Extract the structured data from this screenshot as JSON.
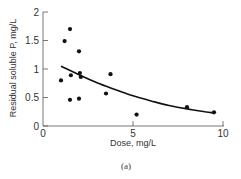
{
  "chart_data": {
    "type": "scatter",
    "title": "",
    "caption": "(a)",
    "xlabel": "Dose, mg/L",
    "ylabel": "Residual soluble P, mg/L",
    "xlim": [
      0,
      10
    ],
    "ylim": [
      0,
      2
    ],
    "x_ticks": [
      "0",
      "5",
      "10"
    ],
    "y_ticks": [
      "0",
      "0.5",
      "1",
      "1.5",
      "2"
    ],
    "grid": false,
    "legend": null,
    "series": [
      {
        "name": "observations",
        "type": "scatter",
        "points": [
          {
            "x": 1.0,
            "y": 0.8
          },
          {
            "x": 1.2,
            "y": 1.49
          },
          {
            "x": 1.5,
            "y": 1.7
          },
          {
            "x": 2.0,
            "y": 1.31
          },
          {
            "x": 1.55,
            "y": 0.89
          },
          {
            "x": 1.5,
            "y": 0.46
          },
          {
            "x": 2.0,
            "y": 0.48
          },
          {
            "x": 2.05,
            "y": 0.93
          },
          {
            "x": 2.1,
            "y": 0.86
          },
          {
            "x": 3.75,
            "y": 0.91
          },
          {
            "x": 3.5,
            "y": 0.57
          },
          {
            "x": 5.2,
            "y": 0.2
          },
          {
            "x": 8.0,
            "y": 0.33
          },
          {
            "x": 9.5,
            "y": 0.24
          }
        ]
      },
      {
        "name": "fitted curve",
        "type": "line",
        "points": [
          {
            "x": 1.0,
            "y": 1.05
          },
          {
            "x": 2.0,
            "y": 0.9
          },
          {
            "x": 3.0,
            "y": 0.76
          },
          {
            "x": 4.0,
            "y": 0.64
          },
          {
            "x": 5.0,
            "y": 0.53
          },
          {
            "x": 6.0,
            "y": 0.44
          },
          {
            "x": 7.0,
            "y": 0.36
          },
          {
            "x": 8.0,
            "y": 0.3
          },
          {
            "x": 9.0,
            "y": 0.25
          },
          {
            "x": 9.5,
            "y": 0.23
          }
        ]
      }
    ]
  }
}
